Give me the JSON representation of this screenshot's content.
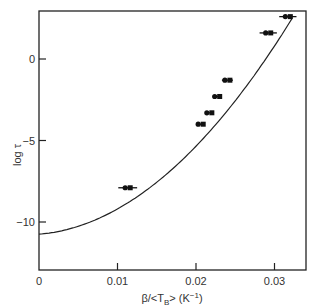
{
  "chart_data": {
    "type": "scatter",
    "title": "",
    "xlabel": "β/<T_B> (K⁻¹)",
    "ylabel": "log τ",
    "xlim": [
      0,
      0.0335
    ],
    "ylim": [
      -13,
      3
    ],
    "x_ticks": [
      0,
      0.01,
      0.02,
      0.03
    ],
    "x_tick_labels": [
      "0",
      "0.01",
      "0.02",
      "0.03"
    ],
    "y_ticks": [
      0,
      -5,
      -10
    ],
    "y_tick_labels": [
      "0",
      "-5",
      "-10"
    ],
    "grid": false,
    "legend": null,
    "series": [
      {
        "name": "data",
        "kind": "points_with_horizontal_error_bars",
        "x": [
          0.0113,
          0.0206,
          0.0217,
          0.0227,
          0.024,
          0.0292,
          0.0317
        ],
        "y": [
          -7.9,
          -4.0,
          -3.3,
          -2.3,
          -1.3,
          1.6,
          2.6
        ],
        "x_err": [
          0.0012,
          0.0005,
          0.0005,
          0.0005,
          0.0007,
          0.0011,
          0.0011
        ]
      },
      {
        "name": "fit curve",
        "kind": "line",
        "x": [
          0,
          0.005,
          0.01,
          0.015,
          0.02,
          0.025,
          0.03,
          0.032
        ],
        "y": [
          -10.75,
          -10.1,
          -8.7,
          -6.6,
          -4.3,
          -1.1,
          2.1,
          3.0
        ]
      }
    ]
  },
  "labels": {
    "y_axis": "log τ",
    "x_axis_prefix": "β/<T",
    "x_axis_sub": "B",
    "x_axis_suffix": "> (K",
    "x_axis_sup": "−1",
    "x_axis_close": ")"
  }
}
